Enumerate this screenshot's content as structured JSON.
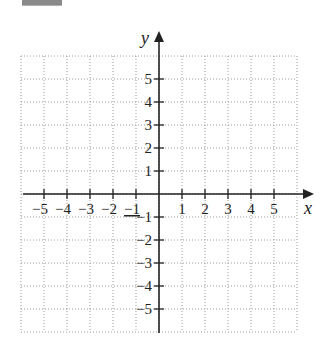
{
  "chart_data": {
    "type": "scatter",
    "title": "",
    "xlabel": "x",
    "ylabel": "y",
    "xlim": [
      -6,
      6
    ],
    "ylim": [
      -6,
      6
    ],
    "grid": true,
    "grid_style": "dotted",
    "x_ticks": [
      -5,
      -4,
      -3,
      -2,
      -1,
      1,
      2,
      3,
      4,
      5
    ],
    "y_ticks": [
      5,
      4,
      3,
      2,
      1,
      -1,
      -2,
      -3,
      -4,
      -5
    ],
    "x_tick_labels": [
      "−5",
      "−4",
      "−3",
      "−2",
      "−1",
      "1",
      "2",
      "3",
      "4",
      "5"
    ],
    "y_tick_labels": [
      "5",
      "4",
      "3",
      "2",
      "1",
      "−1",
      "−2",
      "−3",
      "−4",
      "−5"
    ],
    "series": []
  },
  "colors": {
    "axis": "#222222",
    "grid": "#9a9a9a",
    "top_box": "#8a8a8a"
  }
}
